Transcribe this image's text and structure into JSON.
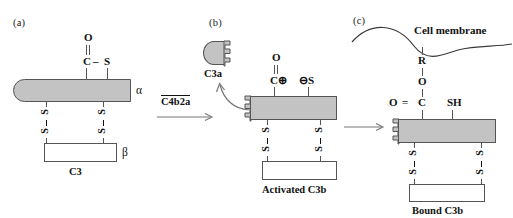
{
  "figure": {
    "background_color": "#ffffff",
    "chain_fill_color": "#c3c3c3",
    "stroke_color": "#555555"
  },
  "panels": {
    "a": {
      "label": "(a)",
      "thioester": {
        "oxygen": "O",
        "double_bond": "||",
        "carbon": "C",
        "bond_dash": "–",
        "sulfur": "S"
      },
      "alpha_label": "α",
      "beta_label": "β",
      "disulfide_top": "S",
      "disulfide_bottom": "S",
      "caption": "C3"
    },
    "b": {
      "label": "(b)",
      "fragment_label": "C3a",
      "thioester": {
        "oxygen": "O",
        "double_bond": "||",
        "carbon_cation": "C⊕",
        "sulfur_anion": "⊖S"
      },
      "disulfide_top": "S",
      "disulfide_bottom": "S",
      "caption": "Activated C3b"
    },
    "c": {
      "label": "(c)",
      "membrane_label": "Cell membrane",
      "linkage": {
        "r_group": "R",
        "ester_oxygen": "O",
        "carbonyl_oxygen": "O",
        "equals": "=",
        "carbon": "C",
        "thiol": "SH"
      },
      "disulfide_top": "S",
      "disulfide_bottom": "S",
      "caption": "Bound C3b"
    }
  },
  "arrows": {
    "convertase": {
      "reagent_label": "C4b2a",
      "direction": "right"
    },
    "release": {
      "direction": "up-left"
    },
    "binding": {
      "direction": "right"
    }
  }
}
